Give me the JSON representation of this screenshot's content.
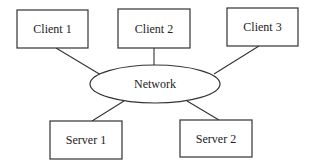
{
  "diagram": {
    "type": "network-topology",
    "nodes": {
      "client1": {
        "label": "Client 1",
        "shape": "rectangle"
      },
      "client2": {
        "label": "Client 2",
        "shape": "rectangle"
      },
      "client3": {
        "label": "Client 3",
        "shape": "rectangle"
      },
      "network": {
        "label": "Network",
        "shape": "ellipse"
      },
      "server1": {
        "label": "Server 1",
        "shape": "rectangle"
      },
      "server2": {
        "label": "Server 2",
        "shape": "rectangle"
      }
    },
    "edges": [
      {
        "from": "client1",
        "to": "network"
      },
      {
        "from": "client2",
        "to": "network"
      },
      {
        "from": "client3",
        "to": "network"
      },
      {
        "from": "server1",
        "to": "network"
      },
      {
        "from": "server2",
        "to": "network"
      }
    ],
    "colors": {
      "stroke": "#333333",
      "fill": "#ffffff",
      "text": "#222222"
    }
  }
}
